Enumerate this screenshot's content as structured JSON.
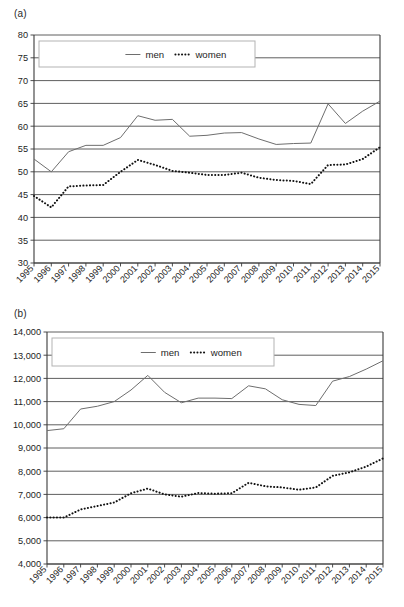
{
  "figure": {
    "panels": [
      {
        "label": "(a)"
      },
      {
        "label": "(b)"
      }
    ]
  },
  "chart_data": [
    {
      "panel": "(a)",
      "type": "line",
      "title": "",
      "xlabel": "",
      "ylabel": "",
      "grid": true,
      "legend_position": "top-center",
      "x": [
        "1995",
        "1996",
        "1997",
        "1998",
        "1999",
        "2000",
        "2001",
        "2002",
        "2003",
        "2004",
        "2005",
        "2006",
        "2007",
        "2008",
        "2009",
        "2010",
        "2011",
        "2012",
        "2013",
        "2014",
        "2015"
      ],
      "xtick_labels": [
        "1995",
        "1996",
        "1997",
        "1998",
        "1999",
        "2000",
        "2001",
        "2002",
        "2003",
        "2004",
        "2005",
        "2006",
        "2007",
        "2008",
        "2009",
        "2010",
        "2011",
        "2012",
        "2013",
        "2014",
        "2015"
      ],
      "ytick_labels": [
        "30",
        "35",
        "40",
        "45",
        "50",
        "55",
        "60",
        "65",
        "70",
        "75",
        "80"
      ],
      "yticks": [
        30,
        35,
        40,
        45,
        50,
        55,
        60,
        65,
        70,
        75,
        80
      ],
      "ylim": [
        30,
        80
      ],
      "series": [
        {
          "name": "men",
          "style": "solid",
          "color": "#6e6e6e",
          "values": [
            52.8,
            50.0,
            54.4,
            55.8,
            55.8,
            57.5,
            62.3,
            61.3,
            61.5,
            57.8,
            58.0,
            58.5,
            58.6,
            57.2,
            56.0,
            56.2,
            56.3,
            64.9,
            60.6,
            63.3,
            65.5
          ]
        },
        {
          "name": "women",
          "style": "dotted",
          "color": "#111111",
          "values": [
            44.7,
            42.2,
            46.8,
            47.0,
            47.1,
            50.0,
            52.6,
            51.5,
            50.2,
            49.8,
            49.3,
            49.3,
            49.8,
            48.7,
            48.2,
            48.0,
            47.3,
            51.5,
            51.6,
            52.8,
            55.4
          ]
        }
      ]
    },
    {
      "panel": "(b)",
      "type": "line",
      "title": "",
      "xlabel": "",
      "ylabel": "",
      "grid": true,
      "legend_position": "top-center",
      "x": [
        "1995",
        "1996",
        "1997",
        "1998",
        "1999",
        "2000",
        "2001",
        "2002",
        "2003",
        "2004",
        "2005",
        "2006",
        "2007",
        "2008",
        "2009",
        "2010",
        "2011",
        "2012",
        "2013",
        "2014",
        "2015"
      ],
      "xtick_labels": [
        "1995",
        "1996",
        "1997",
        "1998",
        "1999",
        "2000",
        "2001",
        "2002",
        "2003",
        "2004",
        "2005",
        "2006",
        "2007",
        "2008",
        "2009",
        "2010",
        "2011",
        "2012",
        "2013",
        "2014",
        "2015"
      ],
      "ytick_labels": [
        "4,000",
        "5,000",
        "6,000",
        "7,000",
        "8,000",
        "9,000",
        "10,000",
        "11,000",
        "12,000",
        "13,000",
        "14,000"
      ],
      "yticks": [
        4000,
        5000,
        6000,
        7000,
        8000,
        9000,
        10000,
        11000,
        12000,
        13000,
        14000
      ],
      "ylim": [
        4000,
        14000
      ],
      "series": [
        {
          "name": "men",
          "style": "solid",
          "color": "#6e6e6e",
          "values": [
            9750,
            9830,
            10680,
            10800,
            11000,
            11500,
            12130,
            11400,
            10950,
            11150,
            11150,
            11130,
            11680,
            11550,
            11080,
            10880,
            10830,
            11880,
            12080,
            12400,
            12760
          ]
        },
        {
          "name": "women",
          "style": "dotted",
          "color": "#111111",
          "values": [
            6000,
            6000,
            6350,
            6500,
            6650,
            7050,
            7250,
            7000,
            6900,
            7060,
            7030,
            7050,
            7500,
            7350,
            7300,
            7200,
            7300,
            7800,
            7950,
            8200,
            8550
          ]
        }
      ]
    }
  ],
  "legend": {
    "men_label": "men",
    "women_label": "women"
  }
}
